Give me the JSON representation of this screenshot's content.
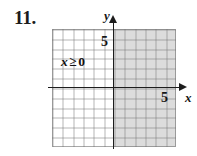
{
  "exercise": {
    "number": "11."
  },
  "graph": {
    "inequality_label": {
      "variable": "x",
      "relation": "≥",
      "value": "0"
    },
    "axes": {
      "x_label": "x",
      "y_label": "y",
      "x_tick_label": "5",
      "y_tick_label": "5"
    },
    "grid": {
      "columns": 12,
      "rows": 12,
      "x_axis_row_from_top": 6,
      "y_axis_column_from_left": 6
    },
    "colors": {
      "shading": "#d6d6d6",
      "axis": "#1d1d1d",
      "gridline": "#787878",
      "background": "#ffffff",
      "text": "#161616"
    }
  },
  "chart_data": {
    "type": "area",
    "title": "",
    "xlabel": "x",
    "ylabel": "y",
    "xlim": [
      -6,
      6
    ],
    "ylim": [
      -6,
      6
    ],
    "xticks": [
      5
    ],
    "yticks": [
      5
    ],
    "grid": true,
    "legend": null,
    "annotations": [
      "x ≥ 0"
    ],
    "series": [
      {
        "name": "x ≥ 0",
        "type": "half-plane-shading",
        "boundary": "x = 0",
        "boundary_style": "solid",
        "shaded_side": "right",
        "x_range": [
          0,
          6
        ],
        "y_range": [
          -6,
          6
        ],
        "fill": "#d6d6d6"
      }
    ]
  }
}
